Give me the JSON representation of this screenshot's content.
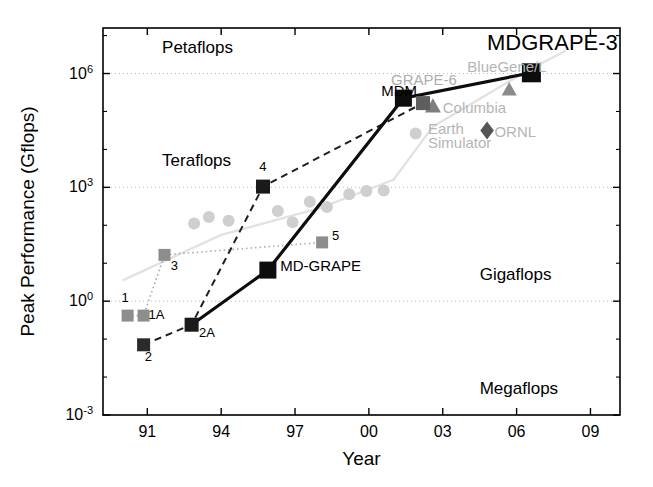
{
  "chart_data": {
    "type": "scatter",
    "title": "",
    "xlabel": "Year",
    "ylabel": "Peak Performance (Gflops)",
    "xlim": [
      1989.2,
      2010.2
    ],
    "ylim_log10": [
      -3,
      7.2
    ],
    "xticks": [
      "91",
      "94",
      "97",
      "00",
      "03",
      "06",
      "09"
    ],
    "xtick_values": [
      1991,
      1994,
      1997,
      2000,
      2003,
      2006,
      2009
    ],
    "yticks": [
      "10-3",
      "100",
      "103",
      "106"
    ],
    "ytick_exponents": [
      "-3",
      "0",
      "3",
      "6"
    ],
    "ytick_values": [
      0.001,
      1,
      1000,
      1000000
    ],
    "grid": "horizontal-dotted",
    "legend": "none",
    "band_labels": [
      {
        "text": "Petaflops",
        "x": 1991.6,
        "y_log10": 6.55
      },
      {
        "text": "Teraflops",
        "x": 1991.6,
        "y_log10": 3.55
      },
      {
        "text": "Gigaflops",
        "x": 2004.5,
        "y_log10": 0.55
      },
      {
        "text": "Megaflops",
        "x": 2004.5,
        "y_log10": -2.45
      }
    ],
    "series": [
      {
        "name": "GRAPE (gray squares, dotted)",
        "marker": "square",
        "color": "#8c8c8c",
        "line": "dotted",
        "points": [
          {
            "label": "1",
            "x": 1990.2,
            "y_log10": -0.38
          },
          {
            "label": "1A",
            "x": 1990.85,
            "y_log10": -0.38
          },
          {
            "label": "3",
            "x": 1991.7,
            "y_log10": 1.22
          },
          {
            "label": "5",
            "x": 1998.1,
            "y_log10": 1.55
          }
        ]
      },
      {
        "name": "MD-GRAPE (black squares, solid)",
        "marker": "square",
        "color": "#111111",
        "line": "solid",
        "points": [
          {
            "label": "2A",
            "x": 1992.8,
            "y_log10": -0.62
          },
          {
            "label": "MD-GRAPE",
            "x": 1995.9,
            "y_log10": 0.82
          },
          {
            "label": "MDM",
            "x": 2001.4,
            "y_log10": 5.35
          },
          {
            "label": "MDGRAPE-3",
            "x": 2006.6,
            "y_log10": 6.02
          }
        ]
      },
      {
        "name": "GRAPE astro (dark squares, dashed)",
        "marker": "square",
        "color": "#3a3a3a",
        "line": "dashed",
        "points": [
          {
            "label": "2",
            "x": 1990.85,
            "y_log10": -1.15
          },
          {
            "label": "2A",
            "x": 1992.8,
            "y_log10": -0.62
          },
          {
            "label": "4",
            "x": 1995.7,
            "y_log10": 3.02
          },
          {
            "label": "GRAPE-6",
            "x": 2002.2,
            "y_log10": 5.22
          }
        ]
      },
      {
        "name": "Top500 #1 (gray circles)",
        "marker": "circle",
        "color": "#c4c4c4",
        "line": "faint-solid",
        "points": [
          {
            "x": 1992.9,
            "y_log10": 2.05
          },
          {
            "x": 1993.5,
            "y_log10": 2.22
          },
          {
            "x": 1994.3,
            "y_log10": 2.12
          },
          {
            "x": 1996.3,
            "y_log10": 2.38
          },
          {
            "x": 1996.9,
            "y_log10": 2.08
          },
          {
            "x": 1997.6,
            "y_log10": 2.62
          },
          {
            "x": 1998.3,
            "y_log10": 2.48
          },
          {
            "x": 1999.2,
            "y_log10": 2.82
          },
          {
            "x": 1999.9,
            "y_log10": 2.9
          },
          {
            "x": 2000.6,
            "y_log10": 2.92
          },
          {
            "x": 2001.9,
            "y_log10": 4.42
          }
        ]
      },
      {
        "name": "Other supercomputers",
        "marker": "mixed",
        "color": "#909090",
        "points": [
          {
            "label": "BlueGene/L",
            "marker": "triangle",
            "x": 2005.7,
            "y_log10": 5.58
          },
          {
            "label": "Columbia",
            "marker": "triangle",
            "x": 2002.6,
            "y_log10": 5.14
          },
          {
            "label": "Earth Simulator",
            "marker": "triangle",
            "x": 2002.6,
            "y_log10": 5.14
          },
          {
            "label": "ORNL",
            "marker": "diamond",
            "x": 2004.8,
            "y_log10": 4.5
          }
        ]
      }
    ],
    "annotations": [
      {
        "text": "MDGRAPE-3",
        "x": 2004.8,
        "y_log10": 6.62,
        "color": "#000000",
        "size": "large"
      },
      {
        "text": "MDM",
        "x": 2000.5,
        "y_log10": 5.4,
        "color": "#000000",
        "size": "medium"
      },
      {
        "text": "MD-GRAPE",
        "x": 1996.4,
        "y_log10": 0.8,
        "color": "#000000",
        "size": "medium"
      },
      {
        "text": "GRAPE-6",
        "x": 2000.9,
        "y_log10": 5.7,
        "color": "#adadad",
        "size": "medium"
      },
      {
        "text": "BlueGene/L",
        "x": 2004.0,
        "y_log10": 6.05,
        "color": "#b5b5b5",
        "size": "medium"
      },
      {
        "text": "Columbia",
        "x": 2003.0,
        "y_log10": 4.95,
        "color": "#b5b5b5",
        "size": "medium"
      },
      {
        "text": "ORNL",
        "x": 2005.1,
        "y_log10": 4.32,
        "color": "#b5b5b5",
        "size": "medium"
      },
      {
        "text": "Earth",
        "x": 2002.4,
        "y_log10": 4.4,
        "color": "#b5b5b5",
        "size": "medium"
      },
      {
        "text": "Simulator",
        "x": 2002.4,
        "y_log10": 4.05,
        "color": "#b5b5b5",
        "size": "medium"
      },
      {
        "text": "1",
        "x": 1989.95,
        "y_log10": -0.02,
        "color": "#000000",
        "size": "small"
      },
      {
        "text": "1A",
        "x": 1991.05,
        "y_log10": -0.48,
        "color": "#000000",
        "size": "small"
      },
      {
        "text": "2",
        "x": 1990.9,
        "y_log10": -1.58,
        "color": "#000000",
        "size": "small"
      },
      {
        "text": "2A",
        "x": 1993.1,
        "y_log10": -0.95,
        "color": "#000000",
        "size": "small"
      },
      {
        "text": "3",
        "x": 1991.95,
        "y_log10": 0.82,
        "color": "#000000",
        "size": "small"
      },
      {
        "text": "4",
        "x": 1995.55,
        "y_log10": 3.42,
        "color": "#000000",
        "size": "small"
      },
      {
        "text": "5",
        "x": 1998.5,
        "y_log10": 1.6,
        "color": "#000000",
        "size": "small"
      }
    ]
  }
}
